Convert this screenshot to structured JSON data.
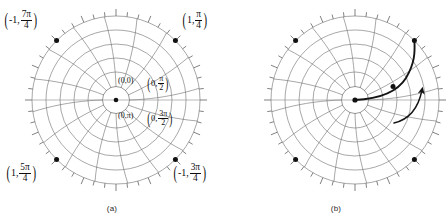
{
  "figure": {
    "width": 448,
    "height": 214,
    "background": "#ffffff",
    "ink": "#000000",
    "grid_color": "#6b6b6b",
    "curve_color": "#141414"
  },
  "panels": [
    {
      "id": "a",
      "caption": "(a)",
      "center": {
        "x": 116,
        "y": 100
      },
      "outer_radius": 84,
      "inner_radius": 13,
      "rings": 5,
      "spokes": 16,
      "tick_count": 48,
      "points": [
        {
          "name": "point-top-left",
          "angle_deg": 135,
          "r": 1.0
        },
        {
          "name": "point-top-right",
          "angle_deg": 45,
          "r": 1.0
        },
        {
          "name": "point-bottom-left",
          "angle_deg": 225,
          "r": 1.0
        },
        {
          "name": "point-bottom-right",
          "angle_deg": 315,
          "r": 1.0
        }
      ],
      "labels": {
        "top_left": {
          "r": "-1",
          "theta_num": "7π",
          "theta_den": "4"
        },
        "top_right": {
          "r": "1",
          "theta_num": "π",
          "theta_den": "4"
        },
        "bottom_left": {
          "r": "1",
          "theta_num": "5π",
          "theta_den": "4"
        },
        "bottom_right": {
          "r": "-1",
          "theta_num": "3π",
          "theta_den": "4"
        },
        "center_upper_left": {
          "text": "(0,0)"
        },
        "center_upper_right": {
          "r": "0",
          "theta_num": "π",
          "theta_den": "2"
        },
        "center_lower_left": {
          "text": "(0,π)"
        },
        "center_lower_right": {
          "r": "0",
          "theta_num": "3π",
          "theta_den": "2"
        }
      }
    },
    {
      "id": "b",
      "caption": "(b)",
      "center": {
        "x": 131,
        "y": 100
      },
      "outer_radius": 84,
      "inner_radius": 13,
      "rings": 5,
      "spokes": 16,
      "tick_count": 48,
      "points": [
        {
          "name": "point-top-left",
          "angle_deg": 135,
          "r": 1.0
        },
        {
          "name": "point-top-right",
          "angle_deg": 45,
          "r": 1.0
        },
        {
          "name": "point-bottom-left",
          "angle_deg": 225,
          "r": 1.0
        },
        {
          "name": "point-bottom-right",
          "angle_deg": 315,
          "r": 1.0
        },
        {
          "name": "point-curve-mid",
          "angle_deg": 12,
          "r": 0.45
        },
        {
          "name": "point-origin",
          "angle_deg": 0,
          "r": 0.0
        }
      ],
      "curve": {
        "name": "spiral-path",
        "description": "spiral from origin outward counterclockwise to upper-right point",
        "has_arrowhead": true
      },
      "direction_arrow": {
        "name": "direction-arrow",
        "description": "small curved arrow showing counterclockwise direction"
      }
    }
  ]
}
